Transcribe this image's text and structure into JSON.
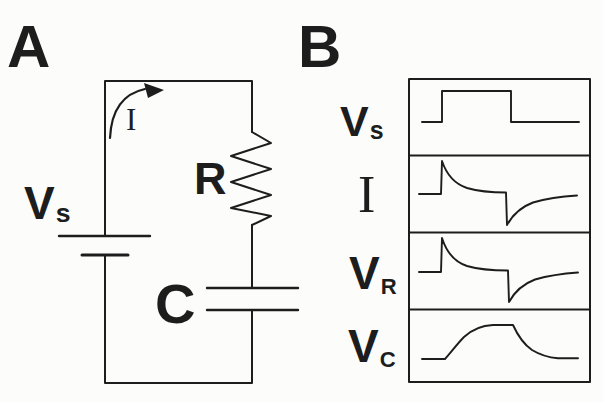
{
  "figure": {
    "ink_color": "#1d1d1d",
    "background_color": "#fcfcfb",
    "panel_a": {
      "label": "A",
      "voltage_source_label": {
        "main": "V",
        "sub": "s"
      },
      "current_arrow_label": "I",
      "resistor_label": "R",
      "capacitor_label": "C",
      "description": "Series RC circuit: voltage source Vs drives current I clockwise through resistor R and capacitor C"
    },
    "panel_b": {
      "label": "B",
      "traces": [
        {
          "main": "V",
          "sub": "s",
          "shape": "square pulse: baseline, step up, hold high, step down, baseline"
        },
        {
          "main": "I",
          "sub": "",
          "shape": "sharp positive spike at pulse onset with exponential decay to baseline, sharp negative spike at pulse offset with exponential recovery"
        },
        {
          "main": "V",
          "sub": "R",
          "shape": "sharp positive spike at pulse onset with exponential decay to baseline, sharp negative spike at pulse offset with exponential recovery"
        },
        {
          "main": "V",
          "sub": "C",
          "shape": "exponential charge up to plateau during pulse, exponential discharge back to baseline after pulse"
        }
      ]
    }
  }
}
